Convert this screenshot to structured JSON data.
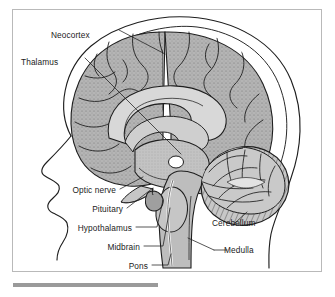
{
  "figure": {
    "type": "mid-sagittal-brain-diagram",
    "title": "",
    "frame": {
      "border_color": "#b9b9b9",
      "background": "#ffffff"
    },
    "palette": {
      "ink": "#1a1a1a",
      "cortex_fill": "#b3b3b3",
      "inner_fill": "#c4c4c4",
      "brainstem_fill": "#bdbdbd",
      "cerebellum_fill": "#c9c9c9",
      "label_text": "#1b1b1b",
      "rule_bar": "#9a9a9a"
    },
    "labels": [
      {
        "id": "neocortex",
        "text": "Neocortex",
        "align": "left",
        "x": 38,
        "y": 25
      },
      {
        "id": "thalamus",
        "text": "Thalamus",
        "align": "left",
        "x": 20,
        "y": 52
      },
      {
        "id": "optic-nerve",
        "text": "Optic nerve",
        "align": "right",
        "x": 115,
        "y": 181
      },
      {
        "id": "pituitary",
        "text": "Pituitary",
        "align": "right",
        "x": 122,
        "y": 200
      },
      {
        "id": "hypothalamus",
        "text": "Hypothalamus",
        "align": "right",
        "x": 131,
        "y": 219
      },
      {
        "id": "midbrain",
        "text": "Midbrain",
        "align": "right",
        "x": 139,
        "y": 238
      },
      {
        "id": "pons",
        "text": "Pons",
        "align": "right",
        "x": 147,
        "y": 257
      },
      {
        "id": "cerebellum",
        "text": "Cerebellum",
        "align": "left",
        "x": 210,
        "y": 226
      },
      {
        "id": "medulla",
        "text": "Medulla",
        "align": "left",
        "x": 222,
        "y": 242
      }
    ],
    "structures": [
      "head profile outline",
      "skull outline",
      "neocortex with gyri and sulci",
      "corpus callosum",
      "thalamus",
      "optic nerve",
      "pituitary gland",
      "hypothalamus",
      "midbrain",
      "pons",
      "medulla",
      "cerebellum with arbor vitae"
    ],
    "rule_bar": {
      "label": "caption-rule"
    }
  }
}
